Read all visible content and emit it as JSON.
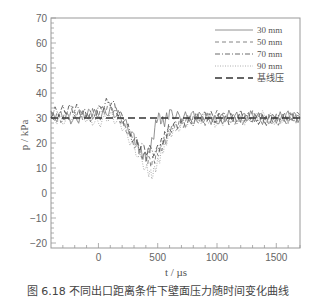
{
  "chart_data": {
    "type": "line",
    "title": "",
    "xlabel": "t / µs",
    "ylabel": "p / kPa",
    "xlim": [
      -400,
      1700
    ],
    "ylim": [
      -22,
      70
    ],
    "x_ticks": [
      0,
      500,
      1000,
      1500
    ],
    "x_tick_labels": [
      "0",
      "500",
      "1000",
      "1500"
    ],
    "y_ticks": [
      70,
      60,
      50,
      40,
      30,
      20,
      10,
      0,
      -10,
      -20
    ],
    "y_tick_labels": [
      "70",
      "60",
      "50",
      "40",
      "30",
      "20",
      "10",
      "0",
      "−10",
      "−20"
    ],
    "grid": false,
    "legend_position": "upper right",
    "series": [
      {
        "name": "30 mm",
        "style": "solid",
        "color": "#777777",
        "x": [
          -400,
          -300,
          -200,
          -100,
          0,
          100,
          200,
          300,
          350,
          400,
          450,
          500,
          550,
          600,
          700,
          800,
          900,
          1000,
          1100,
          1200,
          1300,
          1400,
          1500,
          1600,
          1700
        ],
        "y": [
          30,
          31,
          29,
          32,
          31,
          33,
          30,
          22,
          17,
          14,
          20,
          31,
          28,
          32,
          30,
          31,
          30,
          29,
          31,
          30,
          31,
          29,
          30,
          31,
          30
        ]
      },
      {
        "name": "50 mm",
        "style": "dashed",
        "color": "#666666",
        "x": [
          -400,
          -300,
          -200,
          -100,
          0,
          100,
          200,
          300,
          400,
          450,
          500,
          550,
          600,
          700,
          800,
          900,
          1000,
          1100,
          1200,
          1300,
          1400,
          1500,
          1600,
          1700
        ],
        "y": [
          31,
          30,
          33,
          30,
          32,
          35,
          29,
          20,
          14,
          12,
          16,
          20,
          25,
          28,
          30,
          29,
          31,
          30,
          29,
          31,
          30,
          29,
          30,
          31
        ]
      },
      {
        "name": "70 mm",
        "style": "dash-dot",
        "color": "#444444",
        "x": [
          -400,
          -300,
          -200,
          -100,
          0,
          100,
          200,
          300,
          400,
          500,
          550,
          600,
          700,
          800,
          900,
          1000,
          1100,
          1200,
          1300,
          1400,
          1500,
          1600,
          1700
        ],
        "y": [
          32,
          33,
          34,
          31,
          33,
          37,
          30,
          21,
          17,
          17,
          22,
          26,
          28,
          29,
          31,
          30,
          29,
          31,
          30,
          29,
          30,
          30,
          30
        ]
      },
      {
        "name": "90 mm",
        "style": "dotted",
        "color": "#999999",
        "x": [
          -400,
          -300,
          -200,
          -100,
          0,
          100,
          200,
          300,
          400,
          450,
          500,
          550,
          600,
          700,
          800,
          900,
          1000,
          1100,
          1200,
          1300,
          1400,
          1500,
          1600,
          1700
        ],
        "y": [
          30,
          29,
          31,
          30,
          28,
          31,
          27,
          18,
          10,
          7,
          12,
          18,
          24,
          27,
          29,
          30,
          28,
          30,
          29,
          30,
          31,
          29,
          30,
          30
        ]
      },
      {
        "name": "基线压",
        "style": "long-dash",
        "color": "#333333",
        "x": [
          -400,
          1700
        ],
        "y": [
          30,
          30
        ]
      }
    ]
  },
  "caption": "图 6.18  不同出口距离条件下壁面压力随时间变化曲线"
}
